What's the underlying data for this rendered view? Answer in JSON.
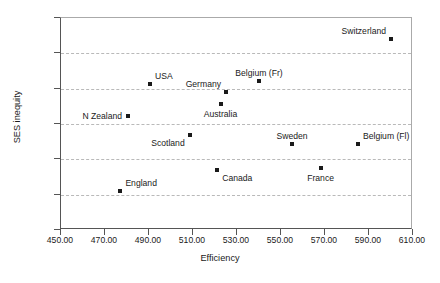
{
  "chart_data": {
    "type": "scatter",
    "title": "",
    "xlabel": "Efficiency",
    "ylabel": "SES inequity",
    "xlim": [
      450.0,
      610.0
    ],
    "ylim": [
      20.0,
      50.0
    ],
    "xticks": [
      "450.00",
      "470.00",
      "490.00",
      "510.00",
      "530.00",
      "550.00",
      "570.00",
      "590.00",
      "610.00"
    ],
    "yticks": [
      "50.00",
      "45.00",
      "40.00",
      "35.00",
      "30.00",
      "25.00",
      "20.00"
    ],
    "grid": "horizontal-dashed",
    "legend": "none",
    "points": [
      {
        "label": "England",
        "x": 477.0,
        "y": 25.5,
        "label_pos": "above-right"
      },
      {
        "label": "N Zealand",
        "x": 480.5,
        "y": 36.2,
        "label_pos": "left"
      },
      {
        "label": "USA",
        "x": 490.5,
        "y": 40.6,
        "label_pos": "above-right"
      },
      {
        "label": "Scotland",
        "x": 508.5,
        "y": 33.4,
        "label_pos": "below-left"
      },
      {
        "label": "Canada",
        "x": 521.0,
        "y": 28.5,
        "label_pos": "below-right"
      },
      {
        "label": "Australia",
        "x": 522.5,
        "y": 37.8,
        "label_pos": "below"
      },
      {
        "label": "Germany",
        "x": 525.0,
        "y": 39.5,
        "label_pos": "above-left"
      },
      {
        "label": "Belgium (Fr)",
        "x": 540.0,
        "y": 41.1,
        "label_pos": "above"
      },
      {
        "label": "Sweden",
        "x": 555.0,
        "y": 32.2,
        "label_pos": "above"
      },
      {
        "label": "France",
        "x": 568.0,
        "y": 28.8,
        "label_pos": "below"
      },
      {
        "label": "Belgium (Fl)",
        "x": 585.0,
        "y": 32.1,
        "label_pos": "above-right"
      },
      {
        "label": "Switzerland",
        "x": 600.0,
        "y": 47.0,
        "label_pos": "above-left"
      }
    ]
  }
}
